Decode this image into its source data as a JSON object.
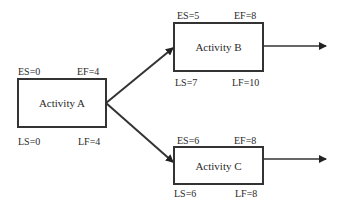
{
  "diagram": {
    "type": "activity-on-node network",
    "activities": [
      {
        "id": "A",
        "label": "Activity A",
        "es": "ES=0",
        "ef": "EF=4",
        "ls": "LS=0",
        "lf": "LF=4"
      },
      {
        "id": "B",
        "label": "Activity B",
        "es": "ES=5",
        "ef": "EF=8",
        "ls": "LS=7",
        "lf": "LF=10"
      },
      {
        "id": "C",
        "label": "Activity C",
        "es": "ES=6",
        "ef": "EF=8",
        "ls": "LS=6",
        "lf": "LF=8"
      }
    ],
    "edges": [
      {
        "from": "A",
        "to": "B"
      },
      {
        "from": "A",
        "to": "C"
      },
      {
        "from": "B",
        "to": "out"
      },
      {
        "from": "C",
        "to": "out"
      }
    ],
    "colors": {
      "line": "#333333",
      "text": "#2a2a2a",
      "background": "#ffffff"
    }
  }
}
